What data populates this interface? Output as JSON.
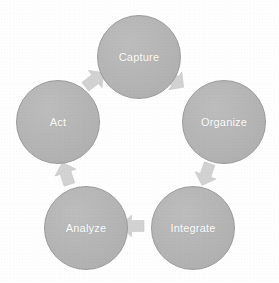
{
  "diagram": {
    "type": "cycle",
    "title": "",
    "background_color": "#ffffff",
    "node_fill_color": "#b4b4b4",
    "node_border_color": "#9a9a9a",
    "node_label_color": "#ffffff",
    "arrow_color": "#d2d2d2",
    "nodes": [
      {
        "id": "capture",
        "label": "Capture",
        "cx": 139,
        "cy": 57,
        "r": 42
      },
      {
        "id": "organize",
        "label": "Organize",
        "cx": 224,
        "cy": 122,
        "r": 42
      },
      {
        "id": "integrate",
        "label": "Integrate",
        "cx": 193,
        "cy": 228,
        "r": 42
      },
      {
        "id": "analyze",
        "label": "Analyze",
        "cx": 86,
        "cy": 228,
        "r": 42
      },
      {
        "id": "act",
        "label": "Act",
        "cx": 58,
        "cy": 122,
        "r": 42
      }
    ],
    "arrows": [
      {
        "id": "capture-to-organize",
        "from": "Capture",
        "to": "Organize",
        "direction": "down-right",
        "angle": 127,
        "x": 160,
        "y": 66
      },
      {
        "id": "organize-to-integrate",
        "from": "Organize",
        "to": "Integrate",
        "direction": "down-left",
        "angle": 199,
        "x": 192,
        "y": 160
      },
      {
        "id": "integrate-to-analyze",
        "from": "Integrate",
        "to": "Analyze",
        "direction": "left",
        "angle": 270,
        "x": 119,
        "y": 212
      },
      {
        "id": "analyze-to-act",
        "from": "Analyze",
        "to": "Act",
        "direction": "up-right",
        "angle": 342,
        "x": 52,
        "y": 160
      },
      {
        "id": "act-to-capture",
        "from": "Act",
        "to": "Capture",
        "direction": "up-right",
        "angle": 52,
        "x": 80,
        "y": 66
      }
    ]
  }
}
